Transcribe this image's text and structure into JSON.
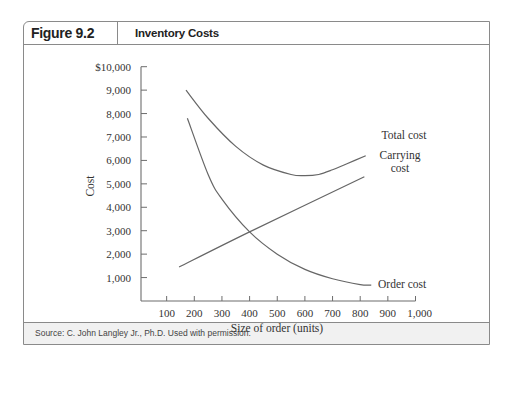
{
  "figure": {
    "label": "Figure 9.2",
    "title": "Inventory Costs",
    "source": "Source: C. John Langley Jr., Ph.D. Used with permission."
  },
  "chart_data": {
    "type": "line",
    "title": "Inventory Costs",
    "xlabel": "Size of order (units)",
    "ylabel": "Cost",
    "xlim": [
      0,
      1000
    ],
    "ylim": [
      0,
      10000
    ],
    "x_ticks": [
      100,
      200,
      300,
      400,
      500,
      600,
      700,
      800,
      900,
      1000
    ],
    "x_tick_labels": [
      "100",
      "200",
      "300",
      "400",
      "500",
      "600",
      "700",
      "800",
      "900",
      "1,000"
    ],
    "y_ticks": [
      1000,
      2000,
      3000,
      4000,
      5000,
      6000,
      7000,
      8000,
      9000,
      10000
    ],
    "y_tick_labels": [
      "1,000",
      "2,000",
      "3,000",
      "4,000",
      "5,000",
      "6,000",
      "7,000",
      "8,000",
      "9,000",
      "$10,000"
    ],
    "grid": false,
    "legend": "inline labels at line ends",
    "series": [
      {
        "name": "Total cost",
        "label_text": [
          "Total cost"
        ],
        "x": [
          170,
          250,
          350,
          450,
          550,
          600,
          650,
          700,
          750,
          820
        ],
        "values": [
          9000,
          7800,
          6600,
          5800,
          5400,
          5350,
          5400,
          5600,
          5850,
          6200
        ]
      },
      {
        "name": "Carrying cost",
        "label_text": [
          "Carrying",
          "cost"
        ],
        "x": [
          145,
          400,
          815
        ],
        "values": [
          1450,
          2950,
          5300
        ]
      },
      {
        "name": "Order cost",
        "label_text": [
          "Order cost"
        ],
        "x": [
          175,
          250,
          300,
          400,
          500,
          600,
          700,
          800,
          840
        ],
        "values": [
          7800,
          5400,
          4350,
          2950,
          2000,
          1350,
          950,
          700,
          680
        ]
      }
    ],
    "annotations": []
  }
}
